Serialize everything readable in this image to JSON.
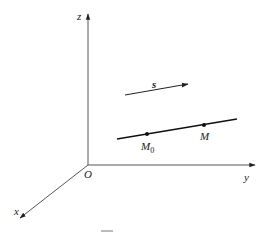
{
  "figure": {
    "axes": {
      "x_label": "x",
      "y_label": "y",
      "z_label": "z",
      "origin_label": "O"
    },
    "vector": {
      "label": "s"
    },
    "line": {
      "points": [
        {
          "label_main": "M",
          "label_sub": "0"
        },
        {
          "label_main": "M",
          "label_sub": ""
        }
      ]
    },
    "colors": {
      "stroke": "#222222",
      "background": "#ffffff",
      "caption_mark": "#bbbbbb"
    }
  }
}
